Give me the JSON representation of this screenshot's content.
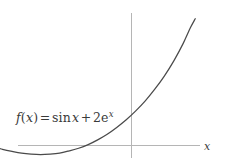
{
  "figure": {
    "background_color": "#ffffff",
    "curve_color": "#4a4a4a",
    "axis_color": "#b5b5b5",
    "text_color": "#3a3a3a"
  },
  "labels": {
    "function_label_text": "f(x) = sin x + 2e^x",
    "fname": "f",
    "open_paren": "(",
    "arg": "x",
    "close_paren": ")",
    "equals": "=",
    "sin": "sin",
    "sin_arg": "x",
    "plus": "+",
    "coefficient": "2",
    "e_base": "e",
    "e_exponent": "x",
    "x_axis_label": "x"
  },
  "chart_data": {
    "type": "line",
    "title": "",
    "subtitle": "",
    "xlabel": "x",
    "ylabel": "",
    "equation": "f(x) = sin x + 2e^x",
    "legend": [],
    "legend_position": "none",
    "grid": false,
    "axes": {
      "x_axis_visible": true,
      "y_axis_visible": true,
      "x_axis_range": [
        -3.6,
        1.45
      ],
      "y_axis_range": [
        -1.1,
        8.6
      ],
      "x_tick_labels": [],
      "y_tick_labels": [],
      "origin_px": [
        131,
        145
      ]
    },
    "series": [
      {
        "name": "f(x) = sin x + 2e^x",
        "color": "#4a4a4a",
        "x": [
          -3.5,
          -3.3,
          -3.1,
          -2.9,
          -2.7,
          -2.5,
          -2.3,
          -2.1,
          -1.9,
          -1.7,
          -1.5,
          -1.3,
          -1.1,
          -0.9,
          -0.7,
          -0.5,
          -0.3,
          -0.1,
          0.1,
          0.3,
          0.5,
          0.7,
          0.9,
          1.1,
          1.25,
          1.35
        ],
        "y": [
          0.41,
          0.23,
          0.05,
          -0.12,
          -0.29,
          -0.43,
          -0.55,
          -0.62,
          -0.65,
          -0.62,
          -0.55,
          -0.4,
          -0.22,
          0.03,
          0.35,
          0.73,
          1.19,
          1.71,
          2.31,
          2.99,
          3.78,
          4.67,
          5.7,
          6.9,
          7.95,
          8.55
        ]
      }
    ],
    "annotations": [
      {
        "text": "f(x) = sin x + 2e^x",
        "x_px": 16,
        "y_px": 122
      }
    ]
  }
}
